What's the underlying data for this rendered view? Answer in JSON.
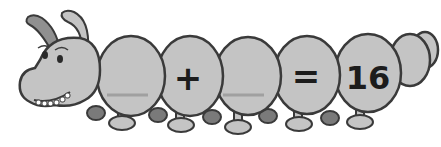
{
  "equation": {
    "blank1": "",
    "operator": "+",
    "blank2": "",
    "equals": "=",
    "result": "16"
  },
  "colors": {
    "body_fill": "#c4c4c4",
    "outline": "#3a3a3a",
    "foot_dark": "#7a7a7a",
    "blank_line": "#a0a0a0",
    "text": "#1c1c1c"
  }
}
